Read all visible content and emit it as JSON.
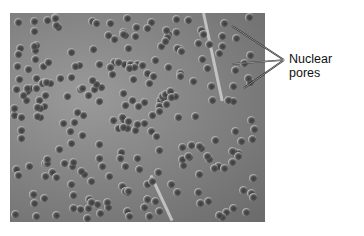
{
  "figure": {
    "label": "Nuclear pores",
    "leader_count": 3
  }
}
